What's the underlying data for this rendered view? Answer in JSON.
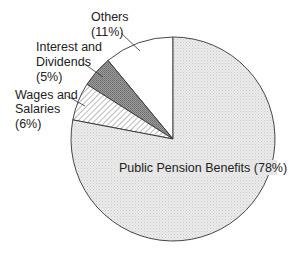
{
  "chart_data": {
    "type": "pie",
    "title": "",
    "start_angle_deg": 0,
    "direction": "counterclockwise",
    "slices": [
      {
        "label": "Others",
        "value": 11,
        "display": "Others\n(11%)",
        "fill": "#ffffff",
        "pattern": "none"
      },
      {
        "label": "Interest and Dividends",
        "value": 5,
        "display": "Interest and\nDividends\n(5%)",
        "fill": "#8a8a8a",
        "pattern": "stipple-dark"
      },
      {
        "label": "Wages and Salaries",
        "value": 6,
        "display": "Wages and\nSalaries\n(6%)",
        "fill": "#ffffff",
        "pattern": "diagonal-hatch"
      },
      {
        "label": "Public Pension Benefits",
        "value": 78,
        "display": "Public Pension Benefits (78%)",
        "fill": "#e4e4e4",
        "pattern": "stipple-light"
      }
    ],
    "legend": "none",
    "labels_position": "outside with leader lines, except largest slice labeled inside"
  },
  "labels": {
    "others": {
      "line1": "Others",
      "line2": "(11%)"
    },
    "interest": {
      "line1": "Interest and",
      "line2": "Dividends",
      "line3": "(5%)"
    },
    "wages": {
      "line1": "Wages and",
      "line2": "Salaries",
      "line3": "(6%)"
    },
    "pension": {
      "line1": "Public Pension Benefits (78%)"
    }
  }
}
